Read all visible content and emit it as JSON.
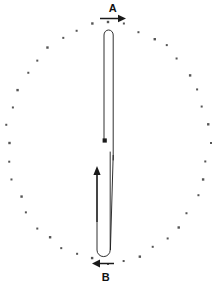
{
  "figure": {
    "type": "technical-line-diagram",
    "background_color": "#ffffff",
    "ink_color": "#1a1a1a",
    "dot_color": "#555555",
    "labels": [
      {
        "id": "A",
        "text": "A",
        "position": "top"
      },
      {
        "id": "B",
        "text": "B",
        "position": "bottom"
      }
    ],
    "arrows": [
      {
        "id": "arrow-a",
        "label": "A",
        "direction": "right",
        "x1": 100,
        "y1": 18,
        "x2": 124,
        "y2": 18
      },
      {
        "id": "arrow-b",
        "label": "B",
        "direction": "left",
        "x1": 114,
        "y1": 263,
        "x2": 93,
        "y2": 263
      },
      {
        "id": "arrow-inner-up",
        "label": "",
        "direction": "up",
        "x1": 97,
        "y1": 222,
        "x2": 97,
        "y2": 167
      },
      {
        "id": "arrow-inner-down",
        "label": "",
        "direction": "down",
        "x1": 105,
        "y1": 40,
        "x2": 105,
        "y2": 141
      }
    ],
    "loops": [
      {
        "id": "upper-hairpin",
        "cap": "top",
        "left_x": 104,
        "right_x": 113,
        "cap_y": 30,
        "tail_y": 141
      },
      {
        "id": "lower-hairpin",
        "cap": "bottom",
        "left_x": 97,
        "right_x": 110,
        "cap_y": 256,
        "tail_y": 155
      }
    ],
    "dot_ring": {
      "center_x": 108,
      "center_y": 143,
      "radius_x": 100,
      "radius_y": 118,
      "count": 40,
      "dot_size": 2,
      "note": "small square markers on an elliptical ring"
    }
  }
}
